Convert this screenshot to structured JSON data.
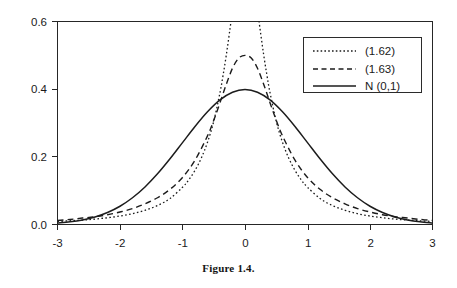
{
  "caption": "Figure 1.4.",
  "chart_data": {
    "type": "line",
    "title": "",
    "subtitle": "",
    "xlabel": "",
    "ylabel": "",
    "xlim": [
      -3,
      3
    ],
    "ylim": [
      0.0,
      0.6
    ],
    "grid": false,
    "legend_position": "top-right",
    "xticks": [
      "-3",
      "-2",
      "-1",
      "0",
      "1",
      "2",
      "3"
    ],
    "xtick_values": [
      -3,
      -2,
      -1,
      0,
      1,
      2,
      3
    ],
    "yticks": [
      "0.0",
      "0.2",
      "0.4",
      "0.6"
    ],
    "ytick_values": [
      0.0,
      0.2,
      0.4,
      0.6
    ],
    "series": [
      {
        "name": "(1.62)",
        "style": "dotted",
        "color": "#1c1c1c",
        "peak_value": 0.6,
        "note": "clipped at top of axis",
        "x": [
          -3.0,
          -2.8,
          -2.6,
          -2.4,
          -2.2,
          -2.0,
          -1.8,
          -1.6,
          -1.4,
          -1.2,
          -1.0,
          -0.9,
          -0.8,
          -0.7,
          -0.6,
          -0.5,
          -0.4,
          -0.35,
          -0.3,
          -0.25,
          -0.2,
          -0.17,
          -0.15,
          0.0,
          0.15,
          0.17,
          0.2,
          0.25,
          0.3,
          0.35,
          0.4,
          0.5,
          0.6,
          0.7,
          0.8,
          0.9,
          1.0,
          1.2,
          1.4,
          1.6,
          1.8,
          2.0,
          2.2,
          2.4,
          2.6,
          2.8,
          3.0
        ],
        "y": [
          0.009,
          0.011,
          0.013,
          0.016,
          0.02,
          0.025,
          0.032,
          0.042,
          0.056,
          0.077,
          0.11,
          0.132,
          0.16,
          0.196,
          0.243,
          0.305,
          0.39,
          0.442,
          0.5,
          0.565,
          0.635,
          0.68,
          0.71,
          1.0,
          0.71,
          0.68,
          0.635,
          0.565,
          0.5,
          0.442,
          0.39,
          0.305,
          0.243,
          0.196,
          0.16,
          0.132,
          0.11,
          0.077,
          0.056,
          0.042,
          0.032,
          0.025,
          0.02,
          0.016,
          0.013,
          0.011,
          0.009
        ]
      },
      {
        "name": "(1.63)",
        "style": "dashed",
        "color": "#1c1c1c",
        "peak_value": 0.5,
        "x": [
          -3.0,
          -2.8,
          -2.6,
          -2.4,
          -2.2,
          -2.0,
          -1.8,
          -1.6,
          -1.4,
          -1.2,
          -1.0,
          -0.8,
          -0.6,
          -0.5,
          -0.4,
          -0.3,
          -0.2,
          -0.1,
          0.0,
          0.1,
          0.2,
          0.3,
          0.4,
          0.5,
          0.6,
          0.8,
          1.0,
          1.2,
          1.4,
          1.6,
          1.8,
          2.0,
          2.2,
          2.4,
          2.6,
          2.8,
          3.0
        ],
        "y": [
          0.012,
          0.015,
          0.019,
          0.023,
          0.029,
          0.037,
          0.047,
          0.061,
          0.079,
          0.104,
          0.139,
          0.19,
          0.262,
          0.308,
          0.36,
          0.414,
          0.462,
          0.492,
          0.5,
          0.492,
          0.462,
          0.414,
          0.36,
          0.308,
          0.262,
          0.19,
          0.139,
          0.104,
          0.079,
          0.061,
          0.047,
          0.037,
          0.029,
          0.023,
          0.019,
          0.015,
          0.012
        ]
      },
      {
        "name": "N (0,1)",
        "style": "solid",
        "color": "#1c1c1c",
        "peak_value": 0.4,
        "x": [
          -3.0,
          -2.8,
          -2.6,
          -2.4,
          -2.2,
          -2.0,
          -1.8,
          -1.6,
          -1.4,
          -1.2,
          -1.0,
          -0.8,
          -0.6,
          -0.4,
          -0.2,
          0.0,
          0.2,
          0.4,
          0.6,
          0.8,
          1.0,
          1.2,
          1.4,
          1.6,
          1.8,
          2.0,
          2.2,
          2.4,
          2.6,
          2.8,
          3.0
        ],
        "y": [
          0.0044,
          0.0079,
          0.0136,
          0.0224,
          0.0355,
          0.054,
          0.079,
          0.1109,
          0.1497,
          0.1942,
          0.242,
          0.2897,
          0.3332,
          0.3683,
          0.391,
          0.3989,
          0.391,
          0.3683,
          0.3332,
          0.2897,
          0.242,
          0.1942,
          0.1497,
          0.1109,
          0.079,
          0.054,
          0.0355,
          0.0224,
          0.0136,
          0.0079,
          0.0044
        ]
      }
    ],
    "legend": [
      {
        "label": "(1.62)",
        "style": "dotted"
      },
      {
        "label": "(1.63)",
        "style": "dashed"
      },
      {
        "label": "N (0,1)",
        "style": "solid"
      }
    ]
  }
}
